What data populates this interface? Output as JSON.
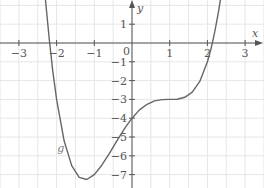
{
  "chart_data": {
    "type": "line",
    "title": "",
    "xlabel": "x",
    "ylabel": "y",
    "xlim": [
      -3.5,
      3.5
    ],
    "ylim": [
      -7.7,
      2.3
    ],
    "grid": true,
    "grid_step_x": 0.5,
    "grid_step_y": 1,
    "x_ticks": [
      -3,
      -2,
      -1,
      1,
      2,
      3
    ],
    "x_tick_labels": [
      "−3",
      "−2",
      "−1",
      "1",
      "2",
      "3"
    ],
    "y_ticks": [
      1,
      -1,
      -2,
      -3,
      -4,
      -5,
      -6,
      -7
    ],
    "y_tick_labels": [
      "1",
      "−1",
      "−2",
      "−3",
      "−4",
      "−5",
      "−6",
      "−7"
    ],
    "origin_label": "0",
    "legend": [],
    "annotations": [
      {
        "text": "g",
        "x": -1.98,
        "y": -5.8
      }
    ],
    "series": [
      {
        "name": "g",
        "x": [
          -2.35,
          -2.3,
          -2.2,
          -2.1,
          -2.0,
          -1.8,
          -1.6,
          -1.4,
          -1.2,
          -1.0,
          -0.8,
          -0.6,
          -0.4,
          -0.2,
          0.0,
          0.2,
          0.4,
          0.6,
          0.8,
          1.0,
          1.2,
          1.4,
          1.6,
          1.8,
          2.0,
          2.1,
          2.2,
          2.3,
          2.4
        ],
        "values": [
          3.58,
          2.39,
          0.28,
          -1.51,
          -3.0,
          -5.2,
          -6.52,
          -7.15,
          -7.26,
          -7.0,
          -6.5,
          -5.87,
          -5.2,
          -4.56,
          -4.0,
          -3.56,
          -3.26,
          -3.08,
          -3.01,
          -3.0,
          -2.99,
          -2.89,
          -2.61,
          -2.03,
          -1.0,
          -0.27,
          0.63,
          1.72,
          3.04
        ]
      }
    ]
  },
  "colors": {
    "grid": "#e6e6e6",
    "axis": "#555555",
    "curve": "#666666"
  },
  "layout": {
    "origin_px": [
      132,
      43
    ],
    "scale_x": 37.7,
    "scale_y": 18.8
  }
}
